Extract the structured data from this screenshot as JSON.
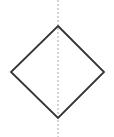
{
  "figure": {
    "label": "a.",
    "canvas": {
      "width": 114,
      "height": 137,
      "background": "#ffffff"
    },
    "shape": {
      "name": "rhombus",
      "stroke_color": "#333333",
      "stroke_width": 1.8,
      "fill": "none",
      "points": "58,26 104,72 58,118 11,72",
      "vertices": [
        {
          "name": "top",
          "x": 58,
          "y": 26
        },
        {
          "name": "right",
          "x": 104,
          "y": 72
        },
        {
          "name": "bottom",
          "x": 58,
          "y": 118
        },
        {
          "name": "left",
          "x": 11,
          "y": 72
        }
      ]
    },
    "symmetry_line": {
      "name": "vertical-line-of-symmetry",
      "orientation": "vertical",
      "stroke_color": "#aaaaaa",
      "stroke_width": 1,
      "dash_pattern": "2 2",
      "x": 58,
      "y1": 0,
      "y2": 137
    }
  }
}
